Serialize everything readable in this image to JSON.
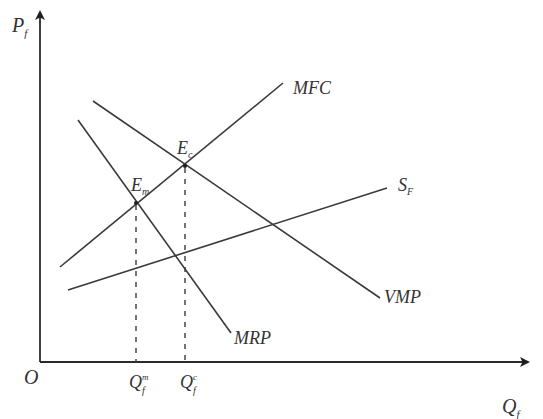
{
  "diagram": {
    "type": "economics-factor-market",
    "axes": {
      "y_label": "P",
      "y_label_sub": "f",
      "x_label": "Q",
      "x_label_sub": "f",
      "origin_label": "O"
    },
    "curves": [
      {
        "id": "mfc",
        "label": "MFC",
        "label_sub": ""
      },
      {
        "id": "vmp",
        "label": "VMP",
        "label_sub": ""
      },
      {
        "id": "mrp",
        "label": "MRP",
        "label_sub": ""
      },
      {
        "id": "sf",
        "label": "S",
        "label_sub": "F"
      }
    ],
    "points": [
      {
        "id": "em",
        "label": "E",
        "label_sub": "m"
      },
      {
        "id": "ec",
        "label": "E",
        "label_sub": "c"
      }
    ],
    "x_ticks": [
      {
        "id": "qm",
        "label": "Q",
        "label_sub": "f",
        "label_sup": "m"
      },
      {
        "id": "qc",
        "label": "Q",
        "label_sub": "f",
        "label_sup": "c"
      }
    ],
    "colors": {
      "line": "#3a3a3a",
      "text": "#333333",
      "background": "#ffffff"
    }
  }
}
